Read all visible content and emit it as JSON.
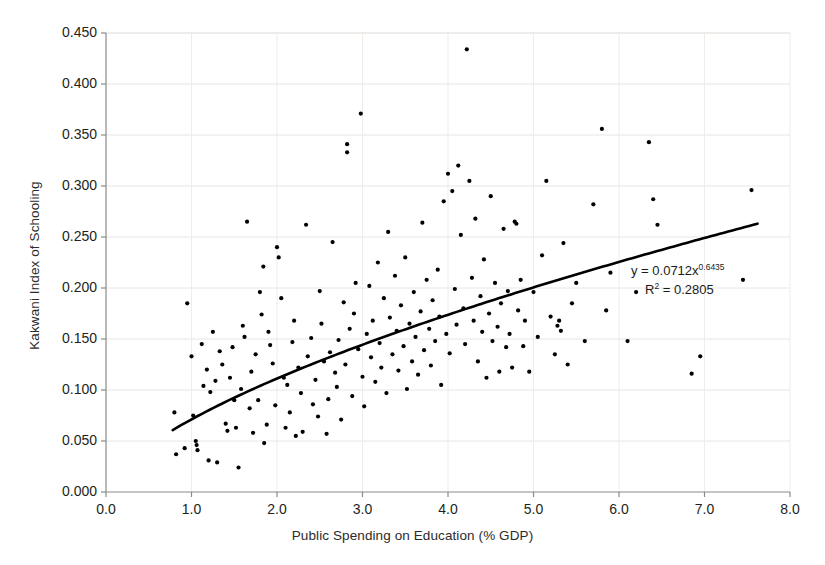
{
  "chart_data": {
    "type": "scatter",
    "title": "",
    "xlabel": "Public Spending on Education (% GDP)",
    "ylabel": "Kakwani Index of Schooling",
    "xlim": [
      0.0,
      8.0
    ],
    "ylim": [
      0.0,
      0.45
    ],
    "xticks": [
      "0.0",
      "1.0",
      "2.0",
      "3.0",
      "4.0",
      "5.0",
      "6.0",
      "7.0",
      "8.0"
    ],
    "yticks": [
      "0.000",
      "0.050",
      "0.100",
      "0.150",
      "0.200",
      "0.250",
      "0.300",
      "0.350",
      "0.400",
      "0.450"
    ],
    "grid": true,
    "legend": null,
    "marker_color": "#000000",
    "marker_size_px": 4.2,
    "trendline": {
      "type": "power",
      "equation_text": "y = 0.0712x",
      "equation_exponent": "0.6435",
      "r2_prefix": "R",
      "r2_sup": "2",
      "r2_text": " = 0.2805",
      "coefficient": 0.0712,
      "exponent": 0.6435,
      "r2": 0.2805,
      "color": "#000000",
      "width_px": 2.6,
      "x_start": 0.78,
      "x_end": 7.62
    },
    "annotations": [
      {
        "name": "trendline-equation",
        "text": "y = 0.0712x^0.6435"
      },
      {
        "name": "trendline-r2",
        "text": "R² = 0.2805"
      }
    ],
    "points": [
      [
        0.8,
        0.078
      ],
      [
        0.82,
        0.037
      ],
      [
        0.92,
        0.043
      ],
      [
        0.95,
        0.185
      ],
      [
        1.0,
        0.133
      ],
      [
        1.02,
        0.075
      ],
      [
        1.05,
        0.05
      ],
      [
        1.06,
        0.046
      ],
      [
        1.07,
        0.041
      ],
      [
        1.12,
        0.145
      ],
      [
        1.14,
        0.104
      ],
      [
        1.18,
        0.12
      ],
      [
        1.2,
        0.031
      ],
      [
        1.22,
        0.098
      ],
      [
        1.25,
        0.157
      ],
      [
        1.28,
        0.109
      ],
      [
        1.3,
        0.029
      ],
      [
        1.33,
        0.138
      ],
      [
        1.36,
        0.125
      ],
      [
        1.4,
        0.067
      ],
      [
        1.42,
        0.06
      ],
      [
        1.45,
        0.112
      ],
      [
        1.48,
        0.142
      ],
      [
        1.5,
        0.09
      ],
      [
        1.52,
        0.063
      ],
      [
        1.55,
        0.024
      ],
      [
        1.58,
        0.101
      ],
      [
        1.6,
        0.163
      ],
      [
        1.62,
        0.152
      ],
      [
        1.65,
        0.265
      ],
      [
        1.68,
        0.082
      ],
      [
        1.7,
        0.118
      ],
      [
        1.72,
        0.058
      ],
      [
        1.75,
        0.135
      ],
      [
        1.78,
        0.09
      ],
      [
        1.8,
        0.196
      ],
      [
        1.82,
        0.174
      ],
      [
        1.84,
        0.221
      ],
      [
        1.85,
        0.048
      ],
      [
        1.88,
        0.066
      ],
      [
        1.9,
        0.157
      ],
      [
        1.92,
        0.144
      ],
      [
        1.95,
        0.126
      ],
      [
        1.98,
        0.085
      ],
      [
        2.0,
        0.24
      ],
      [
        2.02,
        0.23
      ],
      [
        2.05,
        0.19
      ],
      [
        2.08,
        0.112
      ],
      [
        2.1,
        0.063
      ],
      [
        2.12,
        0.105
      ],
      [
        2.15,
        0.078
      ],
      [
        2.18,
        0.147
      ],
      [
        2.2,
        0.168
      ],
      [
        2.22,
        0.055
      ],
      [
        2.25,
        0.122
      ],
      [
        2.28,
        0.097
      ],
      [
        2.3,
        0.059
      ],
      [
        2.34,
        0.262
      ],
      [
        2.36,
        0.133
      ],
      [
        2.4,
        0.151
      ],
      [
        2.42,
        0.086
      ],
      [
        2.45,
        0.11
      ],
      [
        2.48,
        0.074
      ],
      [
        2.5,
        0.197
      ],
      [
        2.52,
        0.165
      ],
      [
        2.55,
        0.128
      ],
      [
        2.58,
        0.057
      ],
      [
        2.6,
        0.091
      ],
      [
        2.62,
        0.137
      ],
      [
        2.65,
        0.245
      ],
      [
        2.68,
        0.117
      ],
      [
        2.7,
        0.103
      ],
      [
        2.72,
        0.149
      ],
      [
        2.75,
        0.071
      ],
      [
        2.78,
        0.186
      ],
      [
        2.8,
        0.125
      ],
      [
        2.82,
        0.333
      ],
      [
        2.82,
        0.341
      ],
      [
        2.85,
        0.16
      ],
      [
        2.88,
        0.094
      ],
      [
        2.9,
        0.175
      ],
      [
        2.92,
        0.205
      ],
      [
        2.95,
        0.14
      ],
      [
        2.98,
        0.371
      ],
      [
        3.0,
        0.113
      ],
      [
        3.02,
        0.084
      ],
      [
        3.05,
        0.155
      ],
      [
        3.08,
        0.202
      ],
      [
        3.1,
        0.132
      ],
      [
        3.12,
        0.168
      ],
      [
        3.15,
        0.108
      ],
      [
        3.18,
        0.225
      ],
      [
        3.2,
        0.146
      ],
      [
        3.22,
        0.122
      ],
      [
        3.25,
        0.19
      ],
      [
        3.28,
        0.097
      ],
      [
        3.3,
        0.255
      ],
      [
        3.32,
        0.171
      ],
      [
        3.35,
        0.135
      ],
      [
        3.38,
        0.212
      ],
      [
        3.4,
        0.158
      ],
      [
        3.42,
        0.119
      ],
      [
        3.45,
        0.183
      ],
      [
        3.48,
        0.143
      ],
      [
        3.5,
        0.23
      ],
      [
        3.52,
        0.101
      ],
      [
        3.55,
        0.165
      ],
      [
        3.58,
        0.128
      ],
      [
        3.6,
        0.196
      ],
      [
        3.62,
        0.152
      ],
      [
        3.65,
        0.115
      ],
      [
        3.68,
        0.177
      ],
      [
        3.7,
        0.264
      ],
      [
        3.72,
        0.139
      ],
      [
        3.75,
        0.208
      ],
      [
        3.78,
        0.16
      ],
      [
        3.8,
        0.124
      ],
      [
        3.82,
        0.188
      ],
      [
        3.85,
        0.148
      ],
      [
        3.88,
        0.218
      ],
      [
        3.9,
        0.172
      ],
      [
        3.92,
        0.105
      ],
      [
        3.95,
        0.285
      ],
      [
        3.98,
        0.155
      ],
      [
        4.0,
        0.312
      ],
      [
        4.02,
        0.136
      ],
      [
        4.05,
        0.295
      ],
      [
        4.08,
        0.199
      ],
      [
        4.1,
        0.164
      ],
      [
        4.12,
        0.32
      ],
      [
        4.15,
        0.252
      ],
      [
        4.18,
        0.18
      ],
      [
        4.2,
        0.145
      ],
      [
        4.22,
        0.434
      ],
      [
        4.25,
        0.305
      ],
      [
        4.28,
        0.21
      ],
      [
        4.3,
        0.168
      ],
      [
        4.32,
        0.268
      ],
      [
        4.35,
        0.128
      ],
      [
        4.38,
        0.192
      ],
      [
        4.4,
        0.157
      ],
      [
        4.42,
        0.228
      ],
      [
        4.45,
        0.112
      ],
      [
        4.48,
        0.175
      ],
      [
        4.5,
        0.29
      ],
      [
        4.52,
        0.148
      ],
      [
        4.55,
        0.205
      ],
      [
        4.58,
        0.162
      ],
      [
        4.6,
        0.118
      ],
      [
        4.62,
        0.185
      ],
      [
        4.65,
        0.258
      ],
      [
        4.68,
        0.142
      ],
      [
        4.7,
        0.197
      ],
      [
        4.72,
        0.155
      ],
      [
        4.75,
        0.122
      ],
      [
        4.78,
        0.265
      ],
      [
        4.8,
        0.263
      ],
      [
        4.82,
        0.178
      ],
      [
        4.85,
        0.208
      ],
      [
        4.88,
        0.143
      ],
      [
        4.9,
        0.168
      ],
      [
        4.95,
        0.118
      ],
      [
        5.0,
        0.196
      ],
      [
        5.05,
        0.152
      ],
      [
        5.1,
        0.232
      ],
      [
        5.15,
        0.305
      ],
      [
        5.2,
        0.172
      ],
      [
        5.25,
        0.135
      ],
      [
        5.28,
        0.163
      ],
      [
        5.3,
        0.168
      ],
      [
        5.32,
        0.158
      ],
      [
        5.35,
        0.244
      ],
      [
        5.4,
        0.125
      ],
      [
        5.45,
        0.185
      ],
      [
        5.5,
        0.205
      ],
      [
        5.6,
        0.148
      ],
      [
        5.7,
        0.282
      ],
      [
        5.8,
        0.356
      ],
      [
        5.85,
        0.178
      ],
      [
        5.9,
        0.215
      ],
      [
        6.1,
        0.148
      ],
      [
        6.2,
        0.196
      ],
      [
        6.35,
        0.343
      ],
      [
        6.4,
        0.287
      ],
      [
        6.45,
        0.262
      ],
      [
        6.85,
        0.116
      ],
      [
        6.95,
        0.133
      ],
      [
        7.45,
        0.208
      ],
      [
        7.55,
        0.296
      ]
    ]
  }
}
